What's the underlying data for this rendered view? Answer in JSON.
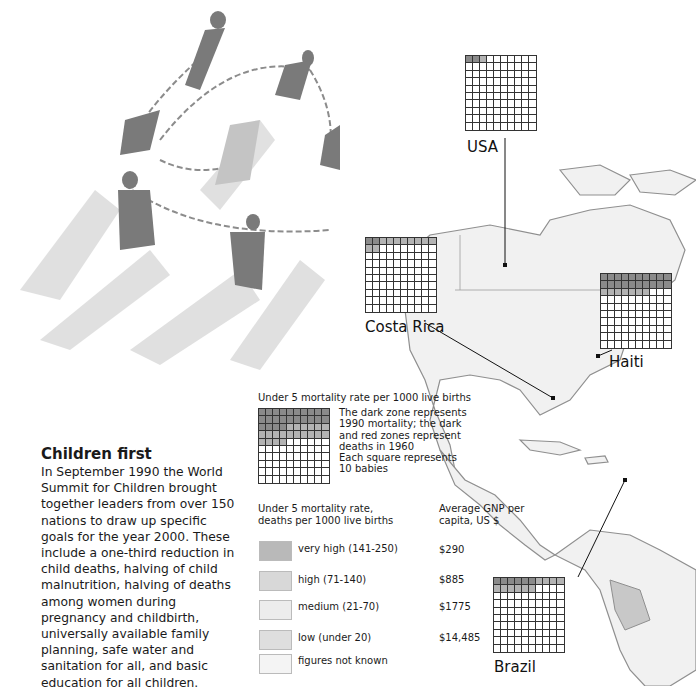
{
  "article": {
    "title": "Children first",
    "body": "In September 1990 the World Summit for Children brought together leaders from over 150 nations to draw up specific goals for the year 2000. These include a one-third reduction in child deaths, halving of child malnutrition, halving of deaths among women during pregnancy and childbirth, universally available family planning, safe water and sanitation for all, and basic education for all children."
  },
  "grid_legend": {
    "title": "Under 5 mortality rate per 1000 live births",
    "note_lines": [
      "The dark zone represents",
      "1990 mortality; the dark",
      "and red zones represent",
      "deaths in 1960",
      "Each square represents",
      "10 babies"
    ],
    "dark_cells": 24,
    "red_cells": 20
  },
  "mortality_legend": {
    "header_left_lines": [
      "Under 5 mortality rate,",
      "deaths per 1000 live births"
    ],
    "header_right_lines": [
      "Average GNP per",
      "capita, US $"
    ],
    "items": [
      {
        "label": "very high (141-250)",
        "gnp": "$290",
        "color": "#b9b9b9"
      },
      {
        "label": "high (71-140)",
        "gnp": "$885",
        "color": "#d8d8d8"
      },
      {
        "label": "medium (21-70)",
        "gnp": "$1775",
        "color": "#ececec"
      },
      {
        "label": "low (under 20)",
        "gnp": "$14,485",
        "color": "#dedede"
      },
      {
        "label": "figures not known",
        "gnp": "",
        "color": "#f4f4f4"
      }
    ]
  },
  "countries": [
    {
      "name": "USA",
      "dark_cells": 2,
      "red_cells": 1
    },
    {
      "name": "Costa Rica",
      "dark_cells": 2,
      "red_cells": 10
    },
    {
      "name": "Haiti",
      "dark_cells": 20,
      "red_cells": 7
    },
    {
      "name": "Brazil",
      "dark_cells": 6,
      "red_cells": 10
    }
  ],
  "chart_data": {
    "type": "table",
    "columns": [
      "Country",
      "Dark squares (1990)",
      "Red squares (additional 1960)"
    ],
    "rows": [
      [
        "USA",
        2,
        1
      ],
      [
        "Costa Rica",
        2,
        10
      ],
      [
        "Haiti",
        20,
        7
      ],
      [
        "Brazil",
        6,
        10
      ]
    ],
    "legend": [
      {
        "category": "very high (141-250)",
        "avg_gnp_per_capita_usd": "$290"
      },
      {
        "category": "high (71-140)",
        "avg_gnp_per_capita_usd": "$885"
      },
      {
        "category": "medium (21-70)",
        "avg_gnp_per_capita_usd": "$1775"
      },
      {
        "category": "low (under 20)",
        "avg_gnp_per_capita_usd": "$14,485"
      },
      {
        "category": "figures not known",
        "avg_gnp_per_capita_usd": ""
      }
    ]
  }
}
